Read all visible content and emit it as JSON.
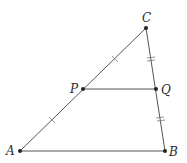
{
  "diagram": {
    "type": "triangle-midsegment",
    "points": {
      "A": {
        "label": "A",
        "x": 20,
        "y": 151
      },
      "B": {
        "label": "B",
        "x": 165,
        "y": 151
      },
      "C": {
        "label": "C",
        "x": 146,
        "y": 28
      },
      "P": {
        "label": "P",
        "x": 83,
        "y": 89
      },
      "Q": {
        "label": "Q",
        "x": 156,
        "y": 89
      }
    },
    "segments": [
      {
        "from": "A",
        "to": "C"
      },
      {
        "from": "C",
        "to": "B"
      },
      {
        "from": "A",
        "to": "B"
      },
      {
        "from": "P",
        "to": "Q"
      }
    ],
    "tick_marks": [
      {
        "segment": "AP",
        "count": 1
      },
      {
        "segment": "PC",
        "count": 1
      },
      {
        "segment": "CQ",
        "count": 2
      },
      {
        "segment": "QB",
        "count": 2
      }
    ],
    "colors": {
      "line": "#555555",
      "point": "#222222",
      "label": "#2a2a2a"
    }
  }
}
